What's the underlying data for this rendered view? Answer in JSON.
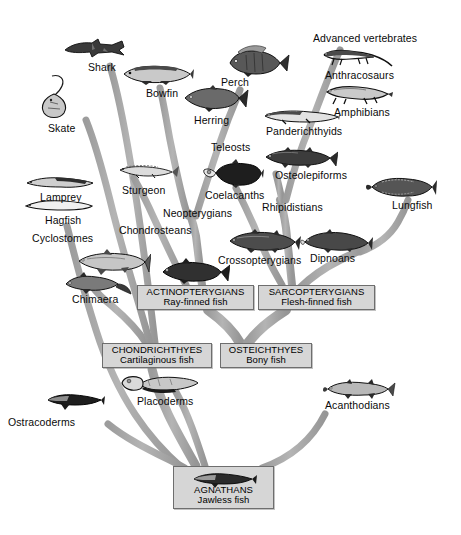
{
  "figure": {
    "type": "phylogenetic-tree",
    "background_color": "#ffffff",
    "branch_color": "#a8a8a8",
    "box_fill_color": "#d6d6d6",
    "box_border_color": "#6e6e6e",
    "text_color": "#0a0a0a"
  },
  "group_boxes": [
    {
      "id": "actinopterygians",
      "title": "ACTINOPTERYGIANS",
      "subtitle": "Ray-finned fish",
      "x": 137,
      "y": 285,
      "w": 117,
      "h": 25
    },
    {
      "id": "sarcopterygians",
      "title": "SARCOPTERYGIANS",
      "subtitle": "Flesh-finned fish",
      "x": 258,
      "y": 285,
      "w": 117,
      "h": 25
    },
    {
      "id": "chondrichthyes",
      "title": "CHONDRICHTHYES",
      "subtitle": "Cartilaginous fish",
      "x": 102,
      "y": 343,
      "w": 110,
      "h": 25
    },
    {
      "id": "osteichthyes",
      "title": "OSTEICHTHYES",
      "subtitle": "Bony fish",
      "x": 220,
      "y": 343,
      "w": 92,
      "h": 25
    },
    {
      "id": "agnathans",
      "title": "AGNATHANS",
      "subtitle": "Jawless fish",
      "x": 173,
      "y": 466,
      "w": 101,
      "h": 43
    }
  ],
  "taxon_labels": [
    {
      "id": "advanced-vertebrates",
      "text": "Advanced vertebrates",
      "x": 313,
      "y": 33
    },
    {
      "id": "shark",
      "text": "Shark",
      "x": 88,
      "y": 62
    },
    {
      "id": "anthracosaurs",
      "text": "Anthracosaurs",
      "x": 325,
      "y": 70
    },
    {
      "id": "bowlin",
      "text": "Bowfin",
      "x": 146,
      "y": 88
    },
    {
      "id": "perch",
      "text": "Perch",
      "x": 221,
      "y": 77
    },
    {
      "id": "amphibians",
      "text": "Amphibians",
      "x": 334,
      "y": 107
    },
    {
      "id": "skate",
      "text": "Skate",
      "x": 48,
      "y": 123
    },
    {
      "id": "herring",
      "text": "Herring",
      "x": 194,
      "y": 115
    },
    {
      "id": "panderichthyids",
      "text": "Panderichthyids",
      "x": 266,
      "y": 126
    },
    {
      "id": "teleosts",
      "text": "Teleosts",
      "x": 211,
      "y": 142
    },
    {
      "id": "osteolepiforms",
      "text": "Osteolepiforms",
      "x": 275,
      "y": 170
    },
    {
      "id": "sturgeon",
      "text": "Sturgeon",
      "x": 122,
      "y": 185
    },
    {
      "id": "coelacanths",
      "text": "Coelacanths",
      "x": 205,
      "y": 190
    },
    {
      "id": "lamprey",
      "text": "Lamprey",
      "x": 40,
      "y": 192
    },
    {
      "id": "neopterygians",
      "text": "Neopterygians",
      "x": 163,
      "y": 208
    },
    {
      "id": "rhipidistians",
      "text": "Rhipidistians",
      "x": 262,
      "y": 202
    },
    {
      "id": "lungfish",
      "text": "Lungfish",
      "x": 392,
      "y": 200
    },
    {
      "id": "hagfish",
      "text": "Hagfish",
      "x": 45,
      "y": 215
    },
    {
      "id": "chondrosteans",
      "text": "Chondrosteans",
      "x": 119,
      "y": 225
    },
    {
      "id": "cyclostomes",
      "text": "Cyclostomes",
      "x": 32,
      "y": 233
    },
    {
      "id": "crossopterygians",
      "text": "Crossopterygians",
      "x": 218,
      "y": 255
    },
    {
      "id": "dipnoans",
      "text": "Dipnoans",
      "x": 310,
      "y": 253
    },
    {
      "id": "chimaera",
      "text": "Chimaera",
      "x": 72,
      "y": 294
    },
    {
      "id": "acanthodians",
      "text": "Acanthodians",
      "x": 325,
      "y": 400
    },
    {
      "id": "placoderms",
      "text": "Placoderms",
      "x": 137,
      "y": 396
    },
    {
      "id": "ostracoderms",
      "text": "Ostracoderms",
      "x": 8,
      "y": 417
    }
  ],
  "organisms": [
    {
      "id": "shark-illustration",
      "label": "shark",
      "x": 62,
      "y": 37,
      "w": 66,
      "h": 22
    },
    {
      "id": "skate-illustration",
      "label": "skate",
      "x": 38,
      "y": 72,
      "w": 34,
      "h": 48
    },
    {
      "id": "bowfin-illustration",
      "label": "bowfin",
      "x": 120,
      "y": 62,
      "w": 74,
      "h": 24
    },
    {
      "id": "perch-illustration",
      "label": "perch",
      "x": 224,
      "y": 43,
      "w": 66,
      "h": 35
    },
    {
      "id": "herring-illustration",
      "label": "herring",
      "x": 181,
      "y": 84,
      "w": 68,
      "h": 28
    },
    {
      "id": "anthracosaurs-illustration",
      "label": "anthracosaur",
      "x": 320,
      "y": 46,
      "w": 74,
      "h": 23
    },
    {
      "id": "amphibians-illustration",
      "label": "amphibian",
      "x": 322,
      "y": 82,
      "w": 72,
      "h": 23
    },
    {
      "id": "panderichthyids-illustration",
      "label": "panderichthyid",
      "x": 262,
      "y": 107,
      "w": 78,
      "h": 18
    },
    {
      "id": "osteolepiforms-illustration",
      "label": "osteolepiform",
      "x": 262,
      "y": 145,
      "w": 76,
      "h": 24
    },
    {
      "id": "sturgeon-illustration",
      "label": "sturgeon",
      "x": 118,
      "y": 161,
      "w": 62,
      "h": 18
    },
    {
      "id": "coelacanths-illustration",
      "label": "coelacanth",
      "x": 202,
      "y": 159,
      "w": 62,
      "h": 29
    },
    {
      "id": "lungfish-illustration",
      "label": "lungfish",
      "x": 366,
      "y": 175,
      "w": 72,
      "h": 24
    },
    {
      "id": "lamprey-illustration",
      "label": "lamprey",
      "x": 25,
      "y": 174,
      "w": 70,
      "h": 16
    },
    {
      "id": "hagfish-illustration",
      "label": "hagfish",
      "x": 24,
      "y": 198,
      "w": 70,
      "h": 14
    },
    {
      "id": "crossopterygians-illustration",
      "label": "crossopterygian",
      "x": 225,
      "y": 228,
      "w": 76,
      "h": 26
    },
    {
      "id": "dipnoans-illustration",
      "label": "dipnoan",
      "x": 300,
      "y": 228,
      "w": 74,
      "h": 25
    },
    {
      "id": "teleost-illustration",
      "label": "teleost",
      "x": 158,
      "y": 258,
      "w": 72,
      "h": 27
    },
    {
      "id": "chondrostean-illustration",
      "label": "chondrostean",
      "x": 75,
      "y": 248,
      "w": 76,
      "h": 28
    },
    {
      "id": "chimaera-illustration",
      "label": "chimaera",
      "x": 62,
      "y": 272,
      "w": 70,
      "h": 24
    },
    {
      "id": "placoderms-illustration",
      "label": "placoderm",
      "x": 118,
      "y": 373,
      "w": 82,
      "h": 23
    },
    {
      "id": "acanthodians-illustration",
      "label": "acanthodian",
      "x": 322,
      "y": 378,
      "w": 74,
      "h": 22
    },
    {
      "id": "ostracoderms-illustration",
      "label": "ostracoderm",
      "x": 45,
      "y": 391,
      "w": 60,
      "h": 20
    },
    {
      "id": "agnathan-illustration",
      "label": "agnathan",
      "x": 190,
      "y": 470,
      "w": 66,
      "h": 20
    }
  ],
  "branches": [
    {
      "id": "trunk-main",
      "from": "agnathans",
      "to": "osteichthyes"
    },
    {
      "id": "branch-chondrichthyes",
      "from": "agnathans",
      "to": "chondrichthyes"
    },
    {
      "id": "branch-ostracoderms",
      "from": "agnathans",
      "to": "ostracoderms"
    },
    {
      "id": "branch-acanthodians",
      "from": "agnathans",
      "to": "acanthodians"
    },
    {
      "id": "branch-placoderms",
      "from": "agnathans",
      "to": "placoderms"
    },
    {
      "id": "branch-actinopterygians",
      "from": "osteichthyes",
      "to": "actinopterygians"
    },
    {
      "id": "branch-sarcopterygians",
      "from": "osteichthyes",
      "to": "sarcopterygians"
    },
    {
      "id": "branch-chimaera",
      "from": "chondrichthyes",
      "to": "chimaera"
    },
    {
      "id": "branch-sharks",
      "from": "chondrichthyes",
      "to": "shark"
    },
    {
      "id": "branch-skate",
      "from": "chondrichthyes",
      "to": "skate"
    },
    {
      "id": "branch-chondrosteans",
      "from": "actinopterygians",
      "to": "chondrosteans"
    },
    {
      "id": "branch-neopterygians",
      "from": "actinopterygians",
      "to": "neopterygians"
    },
    {
      "id": "branch-bowfin",
      "from": "neopterygians",
      "to": "bowfin"
    },
    {
      "id": "branch-teleosts",
      "from": "neopterygians",
      "to": "teleosts"
    },
    {
      "id": "branch-coelacanths",
      "from": "sarcopterygians",
      "to": "coelacanths"
    },
    {
      "id": "branch-rhipidistians",
      "from": "sarcopterygians",
      "to": "rhipidistians"
    },
    {
      "id": "branch-dipnoans",
      "from": "sarcopterygians",
      "to": "dipnoans"
    },
    {
      "id": "branch-lungfish",
      "from": "dipnoans",
      "to": "lungfish"
    },
    {
      "id": "branch-osteolepiforms",
      "from": "rhipidistians",
      "to": "osteolepiforms"
    },
    {
      "id": "branch-tetrapods",
      "from": "rhipidistians",
      "to": "advanced-vertebrates"
    },
    {
      "id": "branch-cyclostomes",
      "from": "agnathans",
      "to": "cyclostomes"
    }
  ]
}
